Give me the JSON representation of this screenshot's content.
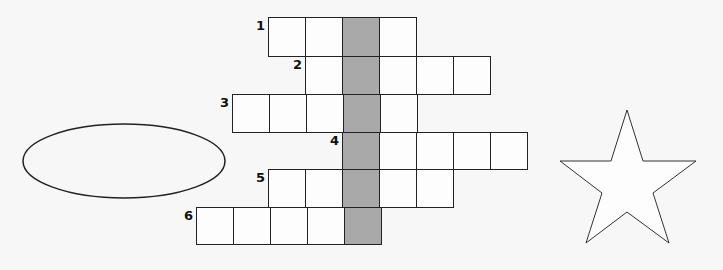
{
  "puzzle": {
    "type": "crossword",
    "cell_size": 37,
    "key_column_x": 342,
    "key_color": "#a9a9a9",
    "rows": [
      {
        "number": "1",
        "top": 17,
        "left": 268,
        "cells": 4
      },
      {
        "number": "2",
        "top": 56,
        "left": 305,
        "cells": 5
      },
      {
        "number": "3",
        "top": 94,
        "left": 232,
        "cells": 5
      },
      {
        "number": "4",
        "top": 132,
        "left": 342,
        "cells": 5
      },
      {
        "number": "5",
        "top": 169,
        "left": 268,
        "cells": 5
      },
      {
        "number": "6",
        "top": 207,
        "left": 196,
        "cells": 5
      }
    ]
  },
  "shapes": {
    "ellipse": {
      "cx": 124,
      "cy": 161,
      "rx": 101,
      "ry": 37
    },
    "star": {
      "points": "627,110 643,161 696,161 653,193 669,243 627,212 586,243 602,193 560,161 611,161"
    }
  }
}
